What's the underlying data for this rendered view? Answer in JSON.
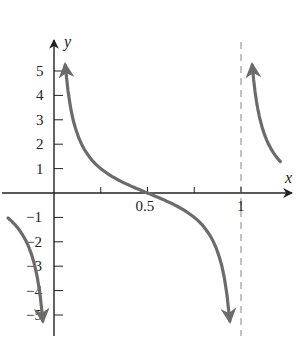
{
  "chart_data": {
    "type": "line",
    "title": "",
    "function": "y = cot(pi x)",
    "xlabel": "x",
    "ylabel": "y",
    "xlim": [
      -0.29,
      1.31
    ],
    "ylim": [
      -5.8,
      6.2
    ],
    "x_ticks": [
      0.25,
      0.5,
      0.75,
      1
    ],
    "x_tick_labels": [
      {
        "value": 0.5,
        "label": "0.5"
      },
      {
        "value": 1,
        "label": "1"
      }
    ],
    "y_ticks": [
      5,
      4,
      3,
      2,
      1,
      -1,
      -2,
      -3,
      -4,
      -5
    ],
    "y_tick_labels": [
      "5",
      "4",
      "3",
      "2",
      "1",
      "−1",
      "−2",
      "−3",
      "−4",
      "−5"
    ],
    "asymptotes": [
      {
        "x": 1,
        "style": "dashed"
      }
    ],
    "grid": false,
    "legend": null,
    "series": [
      {
        "name": "branch-left",
        "x": [
          -0.246,
          -0.2,
          -0.15,
          -0.1,
          -0.06
        ],
        "values": [
          -1.03,
          -1.38,
          -1.96,
          -3.08,
          -5.24
        ]
      },
      {
        "name": "branch-middle",
        "x": [
          0.06,
          0.1,
          0.15,
          0.2,
          0.25,
          0.3,
          0.35,
          0.4,
          0.45,
          0.5,
          0.55,
          0.6,
          0.65,
          0.7,
          0.75,
          0.8,
          0.85,
          0.9,
          0.94
        ],
        "values": [
          5.24,
          3.08,
          1.96,
          1.38,
          1.0,
          0.73,
          0.51,
          0.32,
          0.16,
          0.0,
          -0.16,
          -0.32,
          -0.51,
          -0.73,
          -1.0,
          -1.38,
          -1.96,
          -3.08,
          -5.24
        ]
      },
      {
        "name": "branch-right",
        "x": [
          1.06,
          1.1,
          1.15,
          1.2,
          1.21
        ],
        "values": [
          5.24,
          3.08,
          1.96,
          1.38,
          1.27
        ]
      }
    ],
    "colors": {
      "curve": "#6b6b6b",
      "axis": "#222222",
      "asymptote": "#9a9a9a"
    }
  }
}
